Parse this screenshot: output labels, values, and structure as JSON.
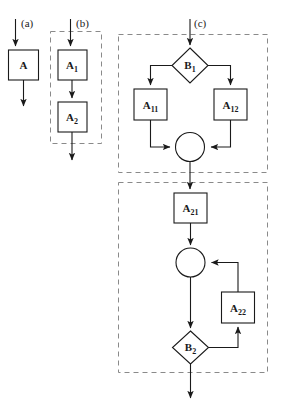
{
  "figure": {
    "type": "flowchart-diagram",
    "background_color": "#ffffff",
    "stroke_color": "#1a1a1a",
    "dashed_color": "#8a8a8a"
  },
  "panels": [
    {
      "id": "a",
      "label": "(a)",
      "dashed_border": false,
      "description": "single activity"
    },
    {
      "id": "b",
      "label": "(b)",
      "dashed_border": true,
      "description": "sequence of two activities"
    },
    {
      "id": "c",
      "label": "(c)",
      "dashed_border": true,
      "description": "branching and looping composition"
    }
  ],
  "nodes": {
    "a_activity": {
      "label": "A",
      "base": "A",
      "sub": "",
      "shape": "box"
    },
    "b_activity_1": {
      "label": "A1",
      "base": "A",
      "sub": "1",
      "shape": "box"
    },
    "b_activity_2": {
      "label": "A2",
      "base": "A",
      "sub": "2",
      "shape": "box"
    },
    "c_decision_1": {
      "label": "B1",
      "base": "B",
      "sub": "1",
      "shape": "diamond"
    },
    "c_activity_11": {
      "label": "A11",
      "base": "A",
      "sub": "11",
      "shape": "box"
    },
    "c_activity_12": {
      "label": "A12",
      "base": "A",
      "sub": "12",
      "shape": "box"
    },
    "c_merge_1": {
      "label": "",
      "base": "",
      "sub": "",
      "shape": "circle"
    },
    "c_activity_21": {
      "label": "A21",
      "base": "A",
      "sub": "21",
      "shape": "box"
    },
    "c_merge_2": {
      "label": "",
      "base": "",
      "sub": "",
      "shape": "circle"
    },
    "c_activity_22": {
      "label": "A22",
      "base": "A",
      "sub": "22",
      "shape": "box"
    },
    "c_decision_2": {
      "label": "B2",
      "base": "B",
      "sub": "2",
      "shape": "diamond"
    }
  }
}
